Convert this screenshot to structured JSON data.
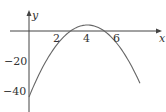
{
  "chart_data": {
    "type": "line",
    "title": "",
    "xlabel": "x",
    "ylabel": "y",
    "x_ticks": [
      2,
      4,
      6
    ],
    "y_ticks": [
      -20,
      -40
    ],
    "xlim": [
      -0.5,
      8.3
    ],
    "ylim": [
      -50,
      10
    ],
    "grid": false,
    "legend": null,
    "series": [
      {
        "name": "y = -3x^2 + 24x - 44",
        "x": [
          0,
          1,
          2,
          2.85,
          3,
          4,
          5,
          5.15,
          6,
          7,
          7.6
        ],
        "y": [
          -44,
          -23,
          -8,
          0,
          1,
          4,
          1,
          0,
          -8,
          -23,
          -34.9
        ]
      }
    ],
    "annotations": []
  },
  "labels": {
    "x_axis": "x",
    "y_axis": "y",
    "tick_2": "2",
    "tick_4": "4",
    "tick_6": "6",
    "tick_m20": "−20",
    "tick_m40": "−40"
  },
  "colors": {
    "axis": "#444444",
    "curve": "#666666"
  }
}
